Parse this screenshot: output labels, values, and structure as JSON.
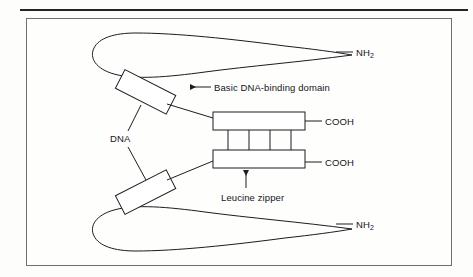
{
  "figure": {
    "type": "diagram",
    "background_color": "#fdfdfc",
    "line_color": "#1c1c22",
    "frame_color": "#6e6e76",
    "rule_color": "#23232a"
  },
  "labels": {
    "nh2_top": "NH",
    "nh2_top_sub": "2",
    "nh2_bottom": "NH",
    "nh2_bottom_sub": "2",
    "cooh_top": "COOH",
    "cooh_bottom": "COOH",
    "basic_domain": "Basic DNA-binding domain",
    "dna": "DNA",
    "leucine_zipper": "Leucine zipper"
  },
  "elements": {
    "dna_strands": 2,
    "binding_domain_boxes": 2,
    "zipper_bars": 2,
    "zipper_rungs": 4,
    "zipper_cells": 3,
    "arrow_to_basic_domain": "left-pointing-arrow",
    "arrow_to_leucine_zipper": "up-pointing-arrow",
    "dna_leader_lines": 2
  }
}
